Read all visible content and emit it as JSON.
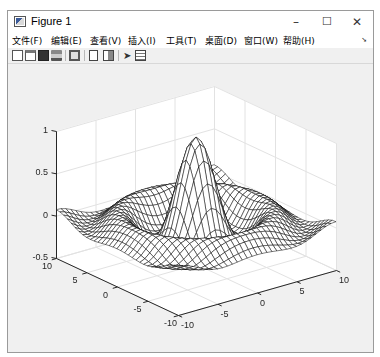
{
  "window": {
    "title": "Figure 1",
    "icon": "matlab-figure-icon",
    "controls": {
      "minimize": "–",
      "maximize": "☐",
      "close": "✕"
    }
  },
  "menubar": {
    "items": [
      {
        "label": "文件(F)"
      },
      {
        "label": "编辑(E)"
      },
      {
        "label": "查看(V)"
      },
      {
        "label": "插入(I)"
      },
      {
        "label": "工具(T)"
      },
      {
        "label": "桌面(D)"
      },
      {
        "label": "窗口(W)"
      },
      {
        "label": "帮助(H)"
      }
    ],
    "dock_arrow": "➘"
  },
  "toolbar": {
    "buttons": [
      {
        "name": "new-figure",
        "icon": "new-file-icon"
      },
      {
        "name": "open-file",
        "icon": "open-folder-icon"
      },
      {
        "name": "save-figure",
        "icon": "save-icon"
      },
      {
        "name": "print-figure",
        "icon": "print-icon"
      },
      {
        "name": "link-plot",
        "icon": "link-plot-icon"
      },
      {
        "name": "insert-colorbar",
        "icon": "colorbar-icon"
      },
      {
        "name": "insert-legend",
        "icon": "legend-icon"
      },
      {
        "name": "edit-plot",
        "icon": "pointer-icon"
      },
      {
        "name": "property-inspector",
        "icon": "property-inspector-icon"
      }
    ]
  },
  "chart_data": {
    "type": "surface-mesh",
    "function": "sinc: z = sin(r)/r, r = sqrt(x^2+y^2)",
    "title": "",
    "xlabel": "",
    "ylabel": "",
    "zlabel": "",
    "xlim": [
      -10,
      10
    ],
    "ylim": [
      -10,
      10
    ],
    "zlim": [
      -0.5,
      1
    ],
    "x_ticks": [
      "-10",
      "-5",
      "0",
      "5",
      "10"
    ],
    "y_ticks": [
      "-10",
      "-5",
      "0",
      "5",
      "10"
    ],
    "z_ticks": [
      "-0.5",
      "0",
      "0.5",
      "1"
    ],
    "grid": true,
    "mesh_color": "#000000",
    "face_color": "#ffffff",
    "mesh_steps": 33,
    "view": "default 3D (az -37.5, el 30)"
  }
}
